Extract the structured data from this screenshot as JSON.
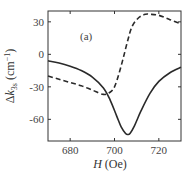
{
  "chart_data": {
    "type": "line",
    "title": "",
    "panel_label": "(a)",
    "xlabel": "H (Oe)",
    "ylabel": "Δk3s (cm⁻¹)",
    "xlim": [
      670,
      730
    ],
    "ylim": [
      -80,
      40
    ],
    "xticks": [
      680,
      700,
      720
    ],
    "yticks": [
      30,
      0,
      -30,
      -60
    ],
    "grid": false,
    "legend": null,
    "series": [
      {
        "name": "solid",
        "style": "solid",
        "x": [
          670,
          675,
          680,
          685,
          690,
          695,
          698,
          701,
          703,
          705,
          706,
          707,
          709,
          712,
          716,
          720,
          725,
          730
        ],
        "y": [
          -6,
          -8,
          -11,
          -15,
          -21,
          -31,
          -42,
          -57,
          -67,
          -73,
          -74,
          -73,
          -66,
          -52,
          -36,
          -25,
          -17,
          -12
        ]
      },
      {
        "name": "dashed",
        "style": "dashed",
        "x": [
          670,
          675,
          680,
          685,
          690,
          695,
          698,
          700,
          702,
          704,
          706,
          708,
          711,
          714,
          716,
          720,
          725,
          730
        ],
        "y": [
          -20,
          -23,
          -26,
          -29,
          -33,
          -37,
          -35,
          -30,
          -18,
          -3,
          13,
          26,
          34,
          37,
          37,
          36,
          32,
          28
        ]
      }
    ]
  },
  "labels": {
    "panel": "(a)",
    "x_italic": "H",
    "x_unit": " (Oe)",
    "y_delta": "Δ",
    "y_var": "k",
    "y_sub": "3s",
    "y_unit": " (cm",
    "y_exp": "−1",
    "y_close": ")"
  }
}
